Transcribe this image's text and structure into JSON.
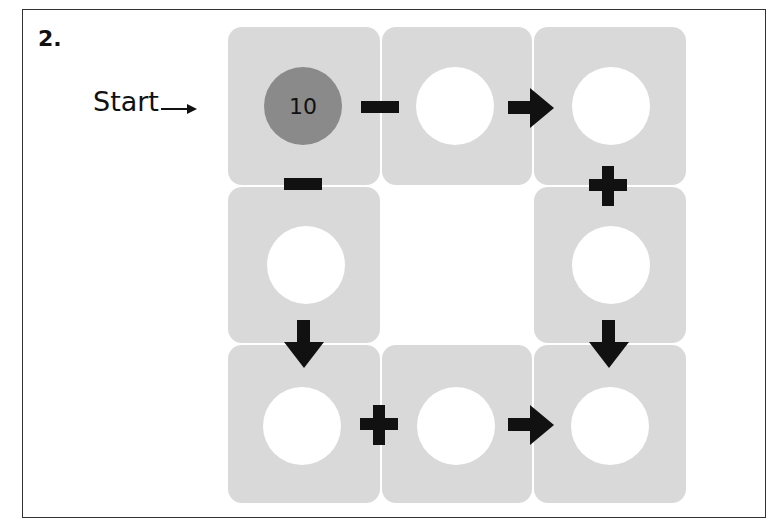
{
  "question": {
    "number": "2."
  },
  "start": {
    "label": "Start",
    "arrow_icon": "right-arrow-icon"
  },
  "puzzle": {
    "start_value": "10",
    "colors": {
      "tile": "#d9d9d9",
      "start_circle": "#8a8a8a",
      "empty_circle": "#ffffff",
      "symbol": "#111111"
    },
    "path": [
      {
        "position": "top-left",
        "value": "10"
      },
      {
        "operator": "minus"
      },
      {
        "position": "top-middle",
        "value": ""
      },
      {
        "connector": "arrow-right"
      },
      {
        "position": "top-right",
        "value": ""
      },
      {
        "operator": "plus"
      },
      {
        "position": "middle-right",
        "value": ""
      },
      {
        "connector": "arrow-down"
      },
      {
        "position": "bottom-right",
        "value": ""
      }
    ],
    "left_path": [
      {
        "position": "top-left",
        "value": "10"
      },
      {
        "operator": "minus"
      },
      {
        "position": "middle-left",
        "value": ""
      },
      {
        "connector": "arrow-down"
      },
      {
        "position": "bottom-left",
        "value": ""
      },
      {
        "operator": "plus"
      },
      {
        "position": "bottom-middle",
        "value": ""
      },
      {
        "connector": "arrow-right"
      },
      {
        "position": "bottom-right",
        "value": ""
      }
    ]
  }
}
